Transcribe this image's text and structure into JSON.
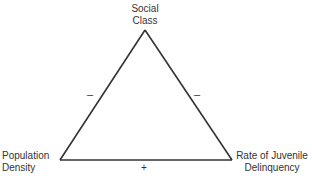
{
  "diagram": {
    "nodes": [
      {
        "id": "social_class",
        "line1": "Social",
        "line2": "Class"
      },
      {
        "id": "population_density",
        "line1": "Population",
        "line2": "Density"
      },
      {
        "id": "juvenile_delinquency",
        "line1": "Rate of Juvenile",
        "line2": "Delinquency"
      }
    ],
    "edges": [
      {
        "from": "social_class",
        "to": "population_density",
        "sign": "–"
      },
      {
        "from": "social_class",
        "to": "juvenile_delinquency",
        "sign": "–"
      },
      {
        "from": "population_density",
        "to": "juvenile_delinquency",
        "sign": "+"
      }
    ],
    "line_color": "#333333"
  }
}
